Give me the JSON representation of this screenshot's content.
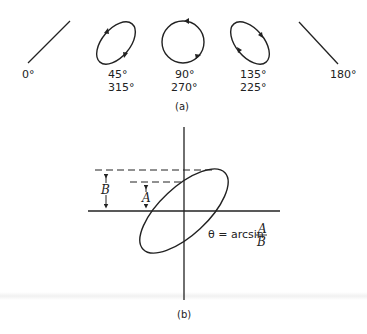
{
  "figure_a": {
    "caption": "(a)",
    "patterns": [
      {
        "shape": "diagonal-line-rising",
        "label1": "0°",
        "label2": ""
      },
      {
        "shape": "ellipse-tilted-right",
        "label1": "45°",
        "label2": "315°"
      },
      {
        "shape": "circle",
        "label1": "90°",
        "label2": "270°"
      },
      {
        "shape": "ellipse-tilted-left",
        "label1": "135°",
        "label2": "225°"
      },
      {
        "shape": "diagonal-line-falling",
        "label1": "180°",
        "label2": ""
      }
    ]
  },
  "figure_b": {
    "caption": "(b)",
    "label_B": "B",
    "label_A": "A",
    "formula_lhs": "θ = arcsin",
    "formula_num": "A",
    "formula_den": "B"
  },
  "colors": {
    "ink": "#222222",
    "background": "#ffffff"
  }
}
